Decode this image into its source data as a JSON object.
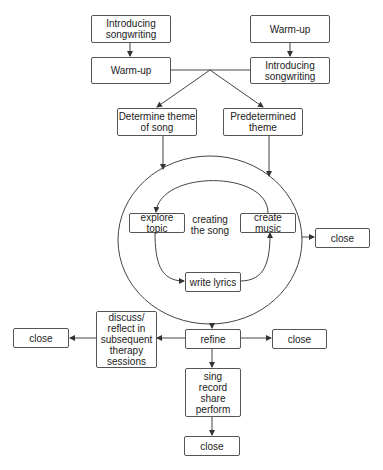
{
  "diagram": {
    "nodes": {
      "intro_left": "Introducing songwriting",
      "warmup_left": "Warm-up",
      "warmup_right": "Warm-up",
      "intro_right": "Introducing songwriting",
      "determine_theme": "Determine theme of song",
      "predetermined_theme": "Predetermined theme",
      "cycle_label": "creating the song",
      "explore_topic": "explore topic",
      "create_music": "create music",
      "write_lyrics": "write lyrics",
      "close_cycle": "close",
      "refine": "refine",
      "discuss": "discuss/ reflect in subsequent therapy sessions",
      "close_left": "close",
      "close_right": "close",
      "sing": "sing record share perform",
      "close_bottom": "close"
    },
    "edges": [
      [
        "intro_left",
        "warmup_left"
      ],
      [
        "warmup_right",
        "intro_right"
      ],
      [
        "warmup_left",
        "junction"
      ],
      [
        "intro_right",
        "junction"
      ],
      [
        "junction",
        "determine_theme"
      ],
      [
        "junction",
        "predetermined_theme"
      ],
      [
        "determine_theme",
        "creating_the_song"
      ],
      [
        "predetermined_theme",
        "creating_the_song"
      ],
      [
        "create_music",
        "explore_topic"
      ],
      [
        "explore_topic",
        "write_lyrics"
      ],
      [
        "write_lyrics",
        "create_music"
      ],
      [
        "creating_the_song",
        "close_cycle"
      ],
      [
        "creating_the_song",
        "refine"
      ],
      [
        "refine",
        "discuss"
      ],
      [
        "discuss",
        "close_left"
      ],
      [
        "refine",
        "close_right"
      ],
      [
        "refine",
        "sing"
      ],
      [
        "sing",
        "close_bottom"
      ]
    ]
  }
}
